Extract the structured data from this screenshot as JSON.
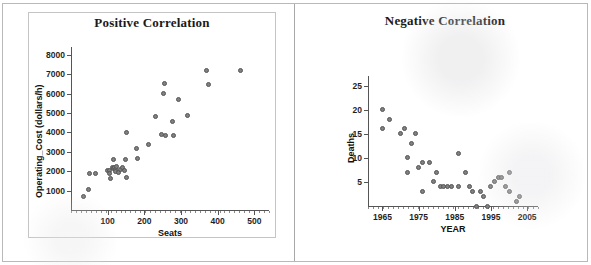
{
  "figure": {
    "panel_count": 2,
    "background_color": "#ffffff",
    "border_color": "#b9b9b9",
    "marker_fill": "#808080",
    "marker_edge": "#555555",
    "axis_color": "#555555"
  },
  "chart_data": [
    {
      "type": "scatter",
      "title": "Positive Correlation",
      "xlabel": "Seats",
      "ylabel": "Operating_Cost (dollars/h)",
      "xlim": [
        0,
        540
      ],
      "ylim": [
        0,
        8400
      ],
      "xticks": [
        100,
        200,
        300,
        400,
        500
      ],
      "yticks": [
        1000,
        2000,
        3000,
        4000,
        5000,
        6000,
        7000,
        8000
      ],
      "xtick_labels": [
        "100",
        "200",
        "300",
        "400",
        "500"
      ],
      "ytick_labels": [
        "1000",
        "2000",
        "3000",
        "4000",
        "5000",
        "6000",
        "7000",
        "8000"
      ],
      "grid": false,
      "legend": "none",
      "points": [
        [
          34,
          700
        ],
        [
          48,
          1040
        ],
        [
          50,
          1900
        ],
        [
          68,
          1880
        ],
        [
          100,
          2050
        ],
        [
          104,
          2020
        ],
        [
          106,
          1900
        ],
        [
          108,
          1620
        ],
        [
          112,
          2170
        ],
        [
          115,
          2600
        ],
        [
          116,
          2120
        ],
        [
          118,
          2180
        ],
        [
          120,
          2080
        ],
        [
          122,
          1980
        ],
        [
          124,
          2220
        ],
        [
          130,
          1930
        ],
        [
          136,
          2100
        ],
        [
          140,
          2180
        ],
        [
          145,
          2050
        ],
        [
          148,
          2600
        ],
        [
          150,
          4000
        ],
        [
          152,
          1700
        ],
        [
          178,
          3180
        ],
        [
          182,
          2640
        ],
        [
          210,
          3400
        ],
        [
          230,
          4800
        ],
        [
          246,
          3890
        ],
        [
          252,
          5990
        ],
        [
          256,
          6530
        ],
        [
          258,
          3860
        ],
        [
          276,
          4570
        ],
        [
          280,
          3840
        ],
        [
          294,
          5720
        ],
        [
          318,
          4890
        ],
        [
          370,
          7200
        ],
        [
          374,
          6450
        ],
        [
          462,
          7200
        ]
      ]
    },
    {
      "type": "scatter",
      "title": "Negative Correlation",
      "xlabel": "YEAR",
      "ylabel": "Deaths",
      "xlim": [
        1961,
        2008
      ],
      "ylim": [
        0,
        27
      ],
      "xticks": [
        1965,
        1975,
        1985,
        1995,
        2005
      ],
      "yticks": [
        5,
        10,
        15,
        20,
        25
      ],
      "xtick_labels": [
        "1965",
        "1975",
        "1985",
        "1995",
        "2005"
      ],
      "ytick_labels": [
        "5",
        "10",
        "15",
        "20",
        "25"
      ],
      "grid": false,
      "legend": "none",
      "points": [
        [
          1965,
          20
        ],
        [
          1965,
          16
        ],
        [
          1967,
          18
        ],
        [
          1970,
          15
        ],
        [
          1971,
          16
        ],
        [
          1974,
          15
        ],
        [
          1973,
          13
        ],
        [
          1972,
          10
        ],
        [
          1972,
          7
        ],
        [
          1975,
          8
        ],
        [
          1976,
          9
        ],
        [
          1978,
          9
        ],
        [
          1976,
          3
        ],
        [
          1979,
          5
        ],
        [
          1980,
          7
        ],
        [
          1981,
          4
        ],
        [
          1982,
          4
        ],
        [
          1983,
          4
        ],
        [
          1984,
          4
        ],
        [
          1986,
          11
        ],
        [
          1986,
          4
        ],
        [
          1988,
          7
        ],
        [
          1989,
          4
        ],
        [
          1990,
          3
        ],
        [
          1991,
          0
        ],
        [
          1992,
          3
        ],
        [
          1993,
          2
        ],
        [
          1994,
          0
        ],
        [
          1995,
          4
        ],
        [
          1996,
          5
        ],
        [
          1997,
          6
        ],
        [
          1998,
          6
        ],
        [
          1999,
          4
        ],
        [
          2000,
          7
        ],
        [
          2000,
          3
        ],
        [
          2002,
          1
        ],
        [
          2003,
          2
        ]
      ]
    }
  ]
}
